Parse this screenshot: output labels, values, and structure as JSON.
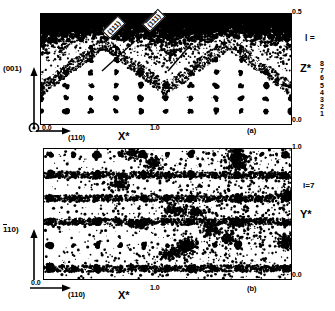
{
  "figure": {
    "type": "diffuse-scattering-reciprocal-space-sections",
    "caption_fragment": ""
  },
  "panel_a": {
    "id_label": "(a)",
    "x_axis": {
      "name": "X*",
      "direction_label": "(110)",
      "ticks": [
        "0.0",
        "1.0"
      ],
      "min": 0.0,
      "max": 2.0
    },
    "y_axis": {
      "name": "Z*",
      "direction_label": "(001)",
      "ticks": [
        "0.0",
        "0.5"
      ],
      "min": 0.0,
      "max": 0.5
    },
    "index_label": "l =",
    "index_ticks": [
      "8",
      "7",
      "6",
      "5",
      "4",
      "3",
      "2",
      "1"
    ],
    "callouts": [
      {
        "text": "(111)",
        "overline": false
      },
      {
        "text": "(111)",
        "overline": true
      }
    ]
  },
  "panel_b": {
    "id_label": "(b)",
    "x_axis": {
      "name": "X*",
      "direction_label": "(110)",
      "ticks": [
        "0.0",
        "1.0"
      ],
      "min": 0.0,
      "max": 2.0
    },
    "y_axis": {
      "name": "Y*",
      "direction_label": "(110)",
      "direction_overline": true,
      "ticks": [
        "0.0",
        "1.0"
      ],
      "min": 0.0,
      "max": 1.0
    },
    "index_label": "l=7"
  },
  "chart_data": {
    "type": "scatter",
    "title": "",
    "panels": [
      {
        "name": "(a)",
        "xlabel": "X*",
        "ylabel": "Z*",
        "xlim": [
          0.0,
          2.0
        ],
        "ylim": [
          0.0,
          0.5
        ],
        "xticks": [
          0.0,
          1.0
        ],
        "yticks": [
          0.0,
          0.5
        ],
        "grid": false,
        "description": "Bragg reflection lattice with strong diffuse cloud filling upper half",
        "bragg_rows_l": [
          1,
          2,
          3,
          4,
          5,
          6,
          7,
          8
        ],
        "bragg_columns_h": [
          0.0,
          0.2,
          0.4,
          0.6,
          0.8,
          1.0,
          1.2,
          1.4,
          1.6,
          1.8,
          2.0
        ],
        "diffuse_boundary": "chevron/zig-zag envelope rising toward top, apexes near X*=0.5 and X*=1.5"
      },
      {
        "name": "(b)",
        "xlabel": "X*",
        "ylabel": "Y*",
        "xlim": [
          0.0,
          2.0
        ],
        "ylim": [
          0.0,
          1.0
        ],
        "xticks": [
          0.0,
          1.0
        ],
        "yticks": [
          0.0,
          1.0
        ],
        "grid": false,
        "description": "l=7 section: regular square array of Bragg spots plus diffuse streaks",
        "bragg_rows_y": [
          0.08,
          0.26,
          0.44,
          0.62,
          0.8,
          0.96
        ],
        "bragg_columns_x": [
          0.05,
          0.24,
          0.43,
          0.62,
          0.81,
          1.0,
          1.19,
          1.38,
          1.57,
          1.76,
          1.95
        ]
      }
    ]
  },
  "colors": {
    "ink": "#000000",
    "background": "#ffffff"
  }
}
